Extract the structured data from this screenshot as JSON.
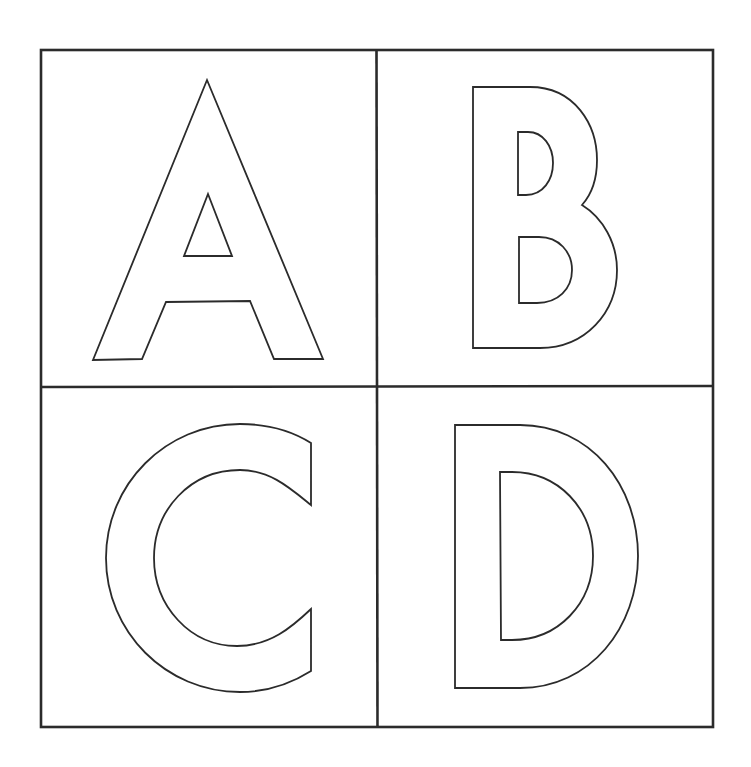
{
  "worksheet": {
    "title": "Alphabet letter outlines A B C D",
    "colors": {
      "background": "#ffffff",
      "stroke": "#2b2b2b"
    },
    "grid": {
      "rows": 2,
      "cols": 2
    },
    "cells": [
      {
        "letter": "A",
        "position": "top-left"
      },
      {
        "letter": "B",
        "position": "top-right"
      },
      {
        "letter": "C",
        "position": "bottom-left"
      },
      {
        "letter": "D",
        "position": "bottom-right"
      }
    ]
  }
}
